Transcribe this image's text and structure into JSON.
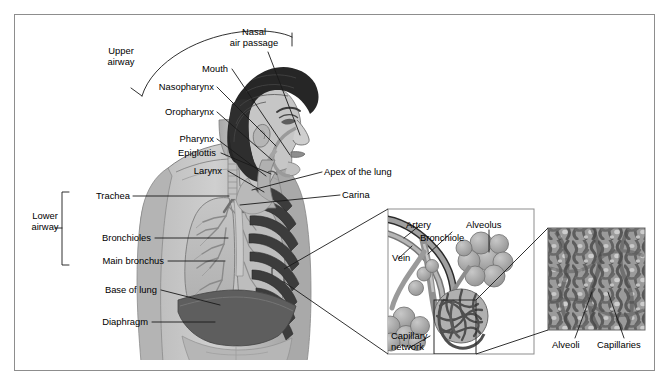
{
  "figure": {
    "frame_color": "#8d8d8d",
    "background": "#ffffff",
    "line_color": "#1a1a1a"
  },
  "brackets": {
    "upper": {
      "line1": "Upper",
      "line2": "airway",
      "shape": "arc"
    },
    "lower": {
      "line1": "Lower",
      "line2": "airway",
      "shape": "square-bracket"
    }
  },
  "upper_airway_labels": [
    {
      "name": "nasal-air-passage",
      "line1": "Nasal",
      "line2": "air passage"
    },
    {
      "name": "mouth",
      "line1": "Mouth",
      "line2": ""
    },
    {
      "name": "nasopharynx",
      "line1": "Nasopharynx",
      "line2": ""
    },
    {
      "name": "oropharynx",
      "line1": "Oropharynx",
      "line2": ""
    },
    {
      "name": "pharynx",
      "line1": "Pharynx",
      "line2": ""
    },
    {
      "name": "epiglottis",
      "line1": "Epiglottis",
      "line2": ""
    },
    {
      "name": "larynx",
      "line1": "Larynx",
      "line2": ""
    }
  ],
  "lower_airway_labels": [
    {
      "name": "trachea",
      "text": "Trachea"
    },
    {
      "name": "bronchioles",
      "text": "Bronchioles"
    },
    {
      "name": "main-bronchus",
      "text": "Main bronchus"
    },
    {
      "name": "base-of-lung",
      "text": "Base of lung"
    },
    {
      "name": "diaphragm",
      "text": "Diaphragm"
    }
  ],
  "center_labels": [
    {
      "name": "apex-of-the-lung",
      "text": "Apex of the lung"
    },
    {
      "name": "carina",
      "text": "Carina"
    }
  ],
  "alveolus_inset": {
    "labels": [
      {
        "name": "artery",
        "text": "Artery"
      },
      {
        "name": "alveolus",
        "text": "Alveolus"
      },
      {
        "name": "bronchiole",
        "text": "Bronchiole"
      },
      {
        "name": "vein",
        "text": "Vein"
      },
      {
        "name": "capillary-network",
        "line1": "Capillary",
        "line2": "network"
      }
    ]
  },
  "micrograph_inset": {
    "labels": [
      {
        "name": "alveoli",
        "text": "Alveoli"
      },
      {
        "name": "capillaries",
        "text": "Capillaries"
      }
    ]
  }
}
